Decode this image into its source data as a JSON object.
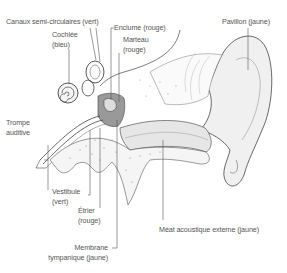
{
  "diagram": {
    "labels": {
      "canaux": "Canaux semi-circulaires (vert)",
      "enclume": "Enclume (rouge)",
      "pavillon": "Pavillon (jaune)",
      "cochlee_1": "Cochlée",
      "cochlee_2": "(bleu)",
      "marteau_1": "Marteau",
      "marteau_2": "(rouge)",
      "trompe_1": "Trompe",
      "trompe_2": "auditive",
      "vestibule_1": "Vestibule",
      "vestibule_2": "(vert)",
      "etrier_1": "Étrier",
      "etrier_2": "(rouge)",
      "membrane_1": "Membrane",
      "membrane_2": "tympanique (jaune)",
      "meat": "Méat acoustique externe (jaune)"
    },
    "colors": {
      "line": "#555555",
      "text": "#555555",
      "shade": "#bbbbbb"
    }
  }
}
